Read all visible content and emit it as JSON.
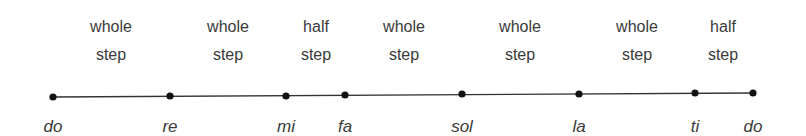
{
  "diagram": {
    "type": "major-scale-steps",
    "line_color": "#333333",
    "notes": [
      {
        "label": "do",
        "x": 53,
        "y": 97
      },
      {
        "label": "re",
        "x": 170,
        "y": 96
      },
      {
        "label": "mi",
        "x": 286,
        "y": 96
      },
      {
        "label": "fa",
        "x": 345,
        "y": 95
      },
      {
        "label": "sol",
        "x": 462,
        "y": 94
      },
      {
        "label": "la",
        "x": 579,
        "y": 94
      },
      {
        "label": "ti",
        "x": 695,
        "y": 93
      },
      {
        "label": "do",
        "x": 753,
        "y": 93
      }
    ],
    "steps": [
      {
        "line1": "whole",
        "line2": "step",
        "x": 111
      },
      {
        "line1": "whole",
        "line2": "step",
        "x": 228
      },
      {
        "line1": "half",
        "line2": "step",
        "x": 316
      },
      {
        "line1": "whole",
        "line2": "step",
        "x": 404
      },
      {
        "line1": "whole",
        "line2": "step",
        "x": 520
      },
      {
        "line1": "whole",
        "line2": "step",
        "x": 637
      },
      {
        "line1": "half",
        "line2": "step",
        "x": 723
      }
    ]
  }
}
